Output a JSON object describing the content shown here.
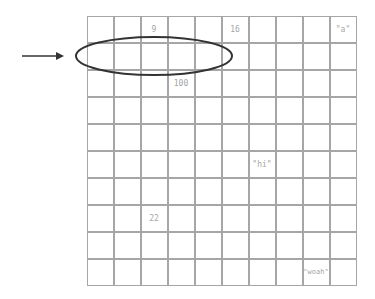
{
  "grid": {
    "rows": 10,
    "cols": 10,
    "line_color": "#a6a6a6",
    "text_color": "#a6a6a6"
  },
  "cells": [
    {
      "row": 0,
      "col": 2,
      "value": "9"
    },
    {
      "row": 0,
      "col": 5,
      "value": "16"
    },
    {
      "row": 0,
      "col": 9,
      "value": "\"a\""
    },
    {
      "row": 2,
      "col": 3,
      "value": "100"
    },
    {
      "row": 5,
      "col": 6,
      "value": "\"hi\""
    },
    {
      "row": 7,
      "col": 2,
      "value": "22"
    },
    {
      "row": 9,
      "col": 8,
      "value": "\"woah\""
    }
  ],
  "annotations": {
    "arrow": {
      "x1": 22,
      "y1": 56,
      "x2": 64,
      "y2": 56,
      "color": "#333333"
    },
    "ellipse": {
      "cx": 154,
      "cy": 56,
      "rx": 78,
      "ry": 19,
      "color": "#333333",
      "label": "row 1 columns 0-4 highlighted"
    }
  }
}
